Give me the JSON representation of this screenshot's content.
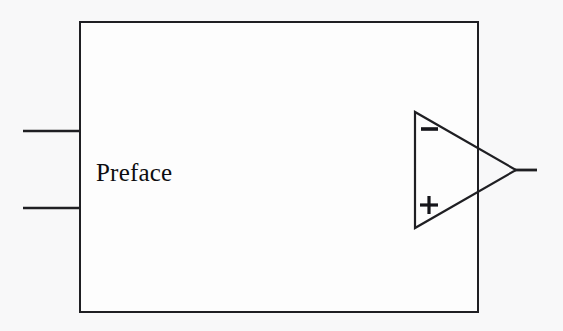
{
  "figure": {
    "background_color": "#f8f8f9",
    "paper_color": "#fdfdfd",
    "ink_color": "#1a1a1e",
    "type": "block-diagram"
  },
  "block": {
    "label": "Preface",
    "shape": "rectangle",
    "x": 80,
    "y": 22,
    "width": 398,
    "height": 290,
    "stroke_color": "#1f1f23",
    "stroke_width": 2,
    "fill_color": "#fdfdfd"
  },
  "opamp": {
    "name": "operational-amplifier",
    "shape": "triangle",
    "apex_x": 516,
    "apex_y": 170,
    "left_x": 415,
    "top_y": 112,
    "bottom_y": 228,
    "stroke_color": "#1f1f23",
    "stroke_width": 2,
    "inverting_label": "−",
    "noninverting_label": "+"
  },
  "wires": [
    {
      "name": "input-wire-top",
      "x1": 23,
      "y1": 131,
      "x2": 81,
      "y2": 131
    },
    {
      "name": "input-wire-bottom",
      "x1": 23,
      "y1": 208,
      "x2": 81,
      "y2": 208
    },
    {
      "name": "output-wire",
      "x1": 515,
      "y1": 170,
      "x2": 537,
      "y2": 170
    }
  ],
  "terminals": {
    "inverting_symbol": "−",
    "noninverting_symbol": "+"
  }
}
